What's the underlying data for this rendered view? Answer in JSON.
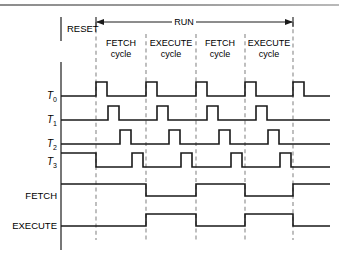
{
  "figure": {
    "type": "timing-diagram",
    "width": 339,
    "height": 261,
    "background": "#ffffff",
    "wave_color": "#1a1a1a",
    "grid_color": "#8a8a8a",
    "axis_color": "#4a4a4a"
  },
  "annotations": {
    "reset_label": "RESET",
    "run_label": "RUN"
  },
  "cycles": [
    {
      "name": "FETCH",
      "line2": "cycle"
    },
    {
      "name": "EXECUTE",
      "line2": "cycle"
    },
    {
      "name": "FETCH",
      "line2": "cycle"
    },
    {
      "name": "EXECUTE",
      "line2": "cycle"
    }
  ],
  "signals": [
    {
      "id": "T0",
      "label": "T",
      "subscript": "0",
      "italic": true
    },
    {
      "id": "T1",
      "label": "T",
      "subscript": "1",
      "italic": true
    },
    {
      "id": "T2",
      "label": "T",
      "subscript": "2",
      "italic": true
    },
    {
      "id": "T3",
      "label": "T",
      "subscript": "3",
      "italic": true
    },
    {
      "id": "FETCH",
      "label": "FETCH",
      "subscript": "",
      "italic": false
    },
    {
      "id": "EXECUTE",
      "label": "EXECUTE",
      "subscript": "",
      "italic": false
    }
  ],
  "chart_data": {
    "type": "line",
    "xlabel": "",
    "ylabel": "",
    "grid": true,
    "legend": "none",
    "cycle_boundaries_px": [
      96,
      146,
      196,
      245,
      293
    ],
    "x_start_px": 61,
    "x_end_px": 330,
    "run_span_px": [
      96,
      293
    ],
    "series": [
      {
        "name": "T0",
        "baseline_y_px": 96,
        "high_y_px": 82,
        "transitions_px": [
          [
            61,
            0
          ],
          [
            96,
            1
          ],
          [
            107,
            0
          ],
          [
            146,
            1
          ],
          [
            157,
            0
          ],
          [
            196,
            1
          ],
          [
            207,
            0
          ],
          [
            245,
            1
          ],
          [
            256,
            0
          ],
          [
            293,
            1
          ],
          [
            304,
            0
          ],
          [
            330,
            0
          ]
        ]
      },
      {
        "name": "T1",
        "baseline_y_px": 120,
        "high_y_px": 106,
        "transitions_px": [
          [
            61,
            0
          ],
          [
            108,
            1
          ],
          [
            119,
            0
          ],
          [
            157,
            1
          ],
          [
            168,
            0
          ],
          [
            207,
            1
          ],
          [
            218,
            0
          ],
          [
            256,
            1
          ],
          [
            267,
            0
          ],
          [
            330,
            0
          ]
        ]
      },
      {
        "name": "T2",
        "baseline_y_px": 144,
        "high_y_px": 130,
        "transitions_px": [
          [
            61,
            0
          ],
          [
            120,
            1
          ],
          [
            131,
            0
          ],
          [
            169,
            1
          ],
          [
            180,
            0
          ],
          [
            219,
            1
          ],
          [
            230,
            0
          ],
          [
            268,
            1
          ],
          [
            279,
            0
          ],
          [
            330,
            0
          ]
        ]
      },
      {
        "name": "T3",
        "baseline_y_px": 167,
        "high_y_px": 153,
        "transitions_px": [
          [
            61,
            1
          ],
          [
            96,
            0
          ],
          [
            132,
            1
          ],
          [
            143,
            0
          ],
          [
            181,
            1
          ],
          [
            192,
            0
          ],
          [
            231,
            1
          ],
          [
            242,
            0
          ],
          [
            280,
            1
          ],
          [
            291,
            0
          ],
          [
            330,
            0
          ]
        ]
      },
      {
        "name": "FETCH",
        "baseline_y_px": 196,
        "high_y_px": 184,
        "transitions_px": [
          [
            61,
            1
          ],
          [
            146,
            0
          ],
          [
            196,
            1
          ],
          [
            245,
            0
          ],
          [
            293,
            1
          ],
          [
            330,
            1
          ]
        ]
      },
      {
        "name": "EXECUTE",
        "baseline_y_px": 226,
        "high_y_px": 214,
        "transitions_px": [
          [
            61,
            0
          ],
          [
            146,
            1
          ],
          [
            196,
            0
          ],
          [
            245,
            1
          ],
          [
            293,
            0
          ],
          [
            330,
            0
          ]
        ]
      }
    ]
  }
}
